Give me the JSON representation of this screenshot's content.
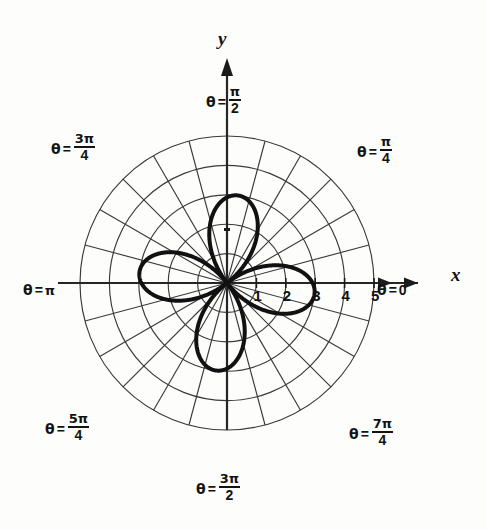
{
  "figure": {
    "kind": "polar-rose-plot",
    "background_color": "#fdfdfc",
    "ink_color": "#131313",
    "grid_color": "#3a3a3a"
  },
  "axes": {
    "x_label": "x",
    "y_label": "y"
  },
  "angle_labels": [
    {
      "id": "theta-0",
      "theta_symbol": "θ",
      "equals": "=",
      "value": "0",
      "frac": null,
      "degrees": 0
    },
    {
      "id": "theta-pi-4",
      "theta_symbol": "θ",
      "equals": "=",
      "value": null,
      "frac": {
        "num": "π",
        "den": "4"
      },
      "degrees": 45
    },
    {
      "id": "theta-pi-2",
      "theta_symbol": "θ",
      "equals": "=",
      "value": null,
      "frac": {
        "num": "π",
        "den": "2"
      },
      "degrees": 90
    },
    {
      "id": "theta-3pi-4",
      "theta_symbol": "θ",
      "equals": "=",
      "value": null,
      "frac": {
        "num": "3π",
        "den": "4"
      },
      "degrees": 135
    },
    {
      "id": "theta-pi",
      "theta_symbol": "θ",
      "equals": "=",
      "value": "π",
      "frac": null,
      "degrees": 180
    },
    {
      "id": "theta-5pi-4",
      "theta_symbol": "θ",
      "equals": "=",
      "value": null,
      "frac": {
        "num": "5π",
        "den": "4"
      },
      "degrees": 225
    },
    {
      "id": "theta-3pi-2",
      "theta_symbol": "θ",
      "equals": "=",
      "value": null,
      "frac": {
        "num": "3π",
        "den": "2"
      },
      "degrees": 270
    },
    {
      "id": "theta-7pi-4",
      "theta_symbol": "θ",
      "equals": "=",
      "value": null,
      "frac": {
        "num": "7π",
        "den": "4"
      },
      "degrees": 315
    }
  ],
  "radial_ticks": [
    {
      "label": "1",
      "r": 1
    },
    {
      "label": "2",
      "r": 2
    },
    {
      "label": "3",
      "r": 3
    },
    {
      "label": "4",
      "r": 4
    },
    {
      "label": "5",
      "r": 5
    }
  ],
  "chart_data": {
    "type": "line",
    "coordinate_system": "polar",
    "title": "",
    "xlabel": "x",
    "ylabel": "y",
    "grid": true,
    "legend": "none",
    "r_range": [
      0,
      5
    ],
    "r_ticks": [
      1,
      2,
      3,
      4,
      5
    ],
    "theta_ticks_deg": [
      0,
      45,
      90,
      135,
      180,
      225,
      270,
      315
    ],
    "theta_tick_labels": [
      "θ = 0",
      "θ = π/4",
      "θ = π/2",
      "θ = 3π/4",
      "θ = π",
      "θ = 5π/4",
      "θ = 3π/2",
      "θ = 7π/4"
    ],
    "grid_circles_r": [
      1,
      2,
      3,
      4,
      5
    ],
    "grid_spokes_deg_step": 15,
    "series": [
      {
        "name": "four-petal rose",
        "equation": "r = 3 sin(2θ)",
        "petal_count": 4,
        "max_r": 3,
        "petal_axis_angles_deg": [
          83,
          173,
          263,
          353
        ],
        "stroke_width_px": 4
      }
    ]
  }
}
